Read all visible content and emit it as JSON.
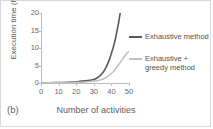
{
  "figure": {
    "panel_label": "(b)"
  },
  "chart_data": {
    "type": "line",
    "title": "",
    "xlabel": "Number of activities",
    "ylabel": "Execution time (h)",
    "xlim": [
      0,
      50
    ],
    "ylim": [
      0,
      20
    ],
    "xticks": [
      0,
      10,
      20,
      30,
      40,
      50
    ],
    "yticks": [
      0,
      5,
      10,
      15,
      20
    ],
    "grid": false,
    "legend_position": "right",
    "series": [
      {
        "name": "Exhaustive method",
        "color": "#595959",
        "x": [
          0,
          5,
          10,
          15,
          20,
          25,
          28,
          30,
          32,
          34,
          36,
          38,
          40,
          42,
          44,
          45
        ],
        "y": [
          0.05,
          0.08,
          0.12,
          0.2,
          0.35,
          0.6,
          0.8,
          1.0,
          1.5,
          2.3,
          3.6,
          5.6,
          8.4,
          12.0,
          17.0,
          20.0
        ]
      },
      {
        "name": "Exhaustive + greedy method",
        "color": "#bfbfbf",
        "x": [
          0,
          5,
          10,
          15,
          20,
          25,
          30,
          33,
          36,
          38,
          40,
          42,
          44,
          46,
          48,
          50
        ],
        "y": [
          0.03,
          0.05,
          0.08,
          0.12,
          0.2,
          0.3,
          0.5,
          0.8,
          1.3,
          1.9,
          2.7,
          3.8,
          5.2,
          6.6,
          8.0,
          9.1
        ]
      }
    ]
  }
}
